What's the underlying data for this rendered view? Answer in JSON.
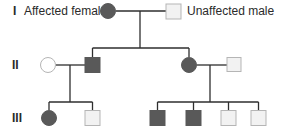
{
  "legend": {
    "affected_female": "Affected female",
    "unaffected_male": "Unaffected male"
  },
  "generations": [
    {
      "label": "I",
      "members": [
        {
          "id": "I-1",
          "sex": "female",
          "status": "affected"
        },
        {
          "id": "I-2",
          "sex": "male",
          "status": "unaffected"
        }
      ]
    },
    {
      "label": "II",
      "members": [
        {
          "id": "II-1",
          "sex": "female",
          "status": "unaffected"
        },
        {
          "id": "II-2",
          "sex": "male",
          "status": "affected"
        },
        {
          "id": "II-3",
          "sex": "female",
          "status": "affected"
        },
        {
          "id": "II-4",
          "sex": "male",
          "status": "unaffected"
        }
      ]
    },
    {
      "label": "III",
      "members": [
        {
          "id": "III-1",
          "sex": "female",
          "status": "affected"
        },
        {
          "id": "III-2",
          "sex": "male",
          "status": "unaffected"
        },
        {
          "id": "III-3",
          "sex": "male",
          "status": "affected"
        },
        {
          "id": "III-4",
          "sex": "male",
          "status": "affected"
        },
        {
          "id": "III-5",
          "sex": "male",
          "status": "unaffected"
        },
        {
          "id": "III-6",
          "sex": "male",
          "status": "unaffected"
        }
      ]
    }
  ],
  "colors": {
    "affected": "#595959",
    "unaffected_fill": "#f2f2f2",
    "outline": "#b5b5b5",
    "line": "#2e2e2e"
  }
}
